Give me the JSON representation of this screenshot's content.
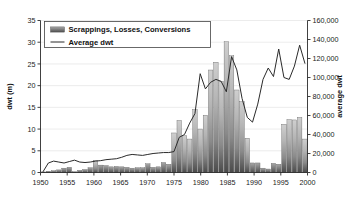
{
  "chart_data": {
    "type": "bar",
    "title": "",
    "subtitle": "",
    "xlabel": "",
    "ylabel": "dwt (m)",
    "y2label": "average dwt",
    "grid": false,
    "legend_position": "top-left",
    "xlim": [
      1950,
      2000
    ],
    "ylim": [
      0,
      35
    ],
    "y2lim": [
      0,
      160000
    ],
    "xticks": [
      "1950",
      "1955",
      "1960",
      "1965",
      "1970",
      "1975",
      "1980",
      "1985",
      "1990",
      "1995",
      "2000"
    ],
    "xtick_values": [
      1950,
      1955,
      1960,
      1965,
      1970,
      1975,
      1980,
      1985,
      1990,
      1995,
      2000
    ],
    "yticks": [
      "0",
      "5",
      "10",
      "15",
      "20",
      "25",
      "30",
      "35"
    ],
    "ytick_values": [
      0,
      5,
      10,
      15,
      20,
      25,
      30,
      35
    ],
    "y2ticks": [
      "0",
      "20,000",
      "40,000",
      "60,000",
      "80,000",
      "100,000",
      "120,000",
      "140,000",
      "160,000"
    ],
    "y2tick_values": [
      0,
      20000,
      40000,
      60000,
      80000,
      100000,
      120000,
      140000,
      160000
    ],
    "legend": [
      {
        "label": "Scrappings, Losses, Conversions",
        "kind": "bar",
        "color": "#8a8a8a"
      },
      {
        "label": "Average dwt",
        "kind": "line",
        "color": "#2a2a2a"
      }
    ],
    "x": [
      1950,
      1951,
      1952,
      1953,
      1954,
      1955,
      1956,
      1957,
      1958,
      1959,
      1960,
      1961,
      1962,
      1963,
      1964,
      1965,
      1966,
      1967,
      1968,
      1969,
      1970,
      1971,
      1972,
      1973,
      1974,
      1975,
      1976,
      1977,
      1978,
      1979,
      1980,
      1981,
      1982,
      1983,
      1984,
      1985,
      1986,
      1987,
      1988,
      1989,
      1990,
      1991,
      1992,
      1993,
      1994,
      1995,
      1996,
      1997,
      1998,
      1999,
      2000
    ],
    "series": [
      {
        "name": "Scrappings, Losses, Conversions",
        "axis": "left",
        "unit": "dwt (m)",
        "values": [
          0.1,
          0.3,
          0.4,
          0.6,
          1.0,
          1.2,
          0.2,
          0.5,
          0.7,
          1.1,
          2.8,
          1.7,
          1.6,
          1.3,
          1.4,
          1.3,
          1.2,
          1.0,
          1.1,
          1.1,
          2.0,
          1.2,
          1.3,
          2.3,
          1.9,
          9.1,
          12.0,
          8.5,
          7.7,
          14.5,
          10.0,
          13.2,
          23.6,
          25.4,
          21.0,
          30.1,
          26.9,
          19.0,
          16.3,
          7.9,
          2.2,
          2.2,
          1.0,
          0.8,
          2.1,
          1.9,
          11.1,
          12.2,
          12.1,
          12.7,
          7.7
        ]
      },
      {
        "name": "Average dwt",
        "axis": "right",
        "unit": "dwt",
        "values": [
          1000,
          10000,
          12000,
          11000,
          10000,
          11500,
          13000,
          11000,
          10500,
          11000,
          12000,
          12500,
          13500,
          14000,
          14500,
          16000,
          18000,
          19000,
          18500,
          18000,
          19000,
          20000,
          20500,
          21000,
          21000,
          22000,
          37000,
          40000,
          52000,
          62000,
          104000,
          88000,
          95000,
          98000,
          96000,
          85000,
          122000,
          108000,
          78000,
          58000,
          53000,
          72000,
          98000,
          110000,
          101000,
          130000,
          100000,
          98000,
          112000,
          134000,
          115000
        ]
      }
    ]
  }
}
